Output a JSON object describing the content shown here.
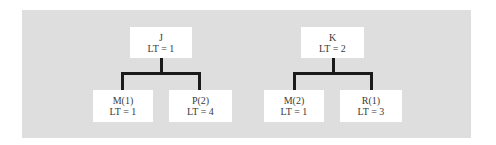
{
  "diagram": {
    "trees": [
      {
        "root": {
          "name": "J",
          "lt": "LT = 1"
        },
        "children": [
          {
            "name": "M(1)",
            "lt": "LT = 1"
          },
          {
            "name": "P(2)",
            "lt": "LT = 4"
          }
        ]
      },
      {
        "root": {
          "name": "K",
          "lt": "LT = 2"
        },
        "children": [
          {
            "name": "M(2)",
            "lt": "LT = 1"
          },
          {
            "name": "R(1)",
            "lt": "LT = 3"
          }
        ]
      }
    ],
    "colors": {
      "panel": "#dedede",
      "node": "#ffffff",
      "line": "#1a1a1a",
      "text": "#3a3a3a"
    }
  }
}
